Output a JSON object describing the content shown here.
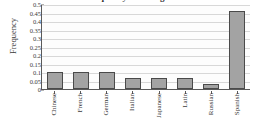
{
  "chart_data": {
    "type": "bar",
    "title": "Relative Frequency of College Students",
    "xlabel": "",
    "ylabel": "Frequency",
    "categories": [
      "Chinese",
      "French",
      "German",
      "Italian",
      "Japanese",
      "Latin",
      "Russian",
      "Spanish"
    ],
    "values": [
      0.1,
      0.1,
      0.1,
      0.065,
      0.065,
      0.065,
      0.03,
      0.46
    ],
    "ylim": [
      0,
      0.5
    ],
    "ytick_labels": [
      "0",
      "0.05",
      "0.1",
      "0.15",
      "0.2",
      "0.25",
      "0.3",
      "0.35",
      "0.4",
      "0.45",
      "0.5"
    ],
    "ytick_values": [
      0,
      0.05,
      0.1,
      0.15,
      0.2,
      0.25,
      0.3,
      0.35,
      0.4,
      0.45,
      0.5
    ],
    "grid": true,
    "legend": null,
    "bar_fill_color": "#a3a3a3",
    "bar_edge_color": "#4a4a4a",
    "grid_color": "#d8d8d8",
    "axis_color": "#5a5a5a",
    "background_color": "#ffffff"
  }
}
